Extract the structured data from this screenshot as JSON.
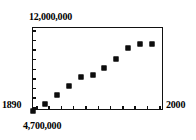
{
  "chart_data": {
    "type": "scatter",
    "title": "",
    "subtitle": "",
    "xlabel": "",
    "ylabel": "",
    "xlim": [
      1890,
      2000
    ],
    "ylim": [
      4700000,
      12000000
    ],
    "grid": false,
    "legend": null,
    "x_tick_labels": [
      "1890",
      "2000"
    ],
    "y_tick_labels": [
      "4,700,000",
      "12,000,000"
    ],
    "x_tick_count": 11,
    "y_tick_count": 9,
    "series": [
      {
        "name": "population",
        "marker": "square",
        "color": "#0d0d0d",
        "x": [
          1890,
          1900,
          1910,
          1920,
          1930,
          1940,
          1950,
          1960,
          1970,
          1980,
          1990
        ],
        "y": [
          4700000,
          5300000,
          6100000,
          6900000,
          7700000,
          7900000,
          8500000,
          9300000,
          10200000,
          10600000,
          10600000
        ]
      }
    ],
    "annotations": []
  },
  "axes": {
    "y_max_label": "12,000,000",
    "y_min_label": "4,700,000",
    "x_min_label": "1890",
    "x_max_label": "2000"
  },
  "colors": {
    "frame": "#111111",
    "marker": "#0d0d0d",
    "background": "#ffffff"
  }
}
